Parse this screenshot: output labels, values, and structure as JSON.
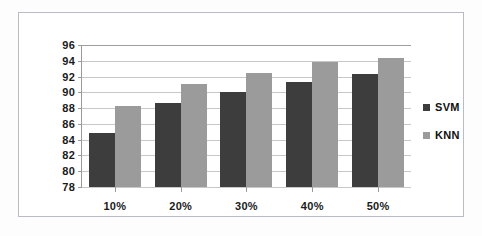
{
  "chart_data": {
    "type": "bar",
    "title": "",
    "subtitle": "",
    "xlabel": "",
    "ylabel": "",
    "categories": [
      "10%",
      "20%",
      "30%",
      "40%",
      "50%"
    ],
    "series": [
      {
        "name": "SVM",
        "color": "#3d3d3d",
        "values": [
          84.8,
          88.7,
          90.0,
          91.3,
          92.3
        ]
      },
      {
        "name": "KNN",
        "color": "#9b9b9b",
        "values": [
          88.3,
          91.1,
          92.4,
          93.9,
          94.4
        ]
      }
    ],
    "ylim": [
      78,
      96
    ],
    "ytick_step": 2,
    "ytick_labels": [
      "96",
      "94",
      "92",
      "90",
      "88",
      "86",
      "84",
      "82",
      "80",
      "78"
    ],
    "grid": true,
    "legend_position": "right",
    "annotations": []
  },
  "legend": {
    "items": [
      {
        "label": "SVM",
        "swatch": "square-swatch-dark"
      },
      {
        "label": "KNN",
        "swatch": "square-swatch-gray"
      }
    ]
  },
  "colors": {
    "svm": "#3d3d3d",
    "knn": "#9b9b9b",
    "gridline": "#c8c8c8",
    "axis": "#9a9a9a",
    "frame": "#b9bcc0",
    "text": "#1a1a1a",
    "background": "#ffffff"
  }
}
